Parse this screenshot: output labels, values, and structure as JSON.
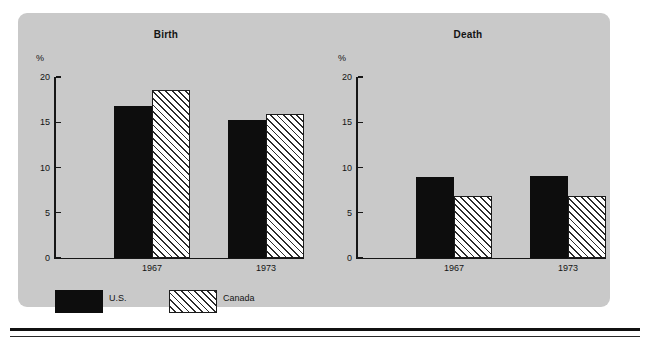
{
  "figure": {
    "background_color": "#c9c9c9",
    "page_color": "#ffffff",
    "rule_color": "#111111"
  },
  "legend": {
    "position": "bottom-left",
    "entries": [
      {
        "label": "U.S.",
        "pattern": "solid-black",
        "color": "#0d0d0d"
      },
      {
        "label": "Canada",
        "pattern": "diagonal-hatch",
        "color": "#ffffff"
      }
    ]
  },
  "chart_data": [
    {
      "type": "bar",
      "title": "Birth",
      "xlabel": "",
      "ylabel": "%",
      "ylim": [
        0,
        20
      ],
      "yticks": [
        0,
        5,
        10,
        15,
        20
      ],
      "ytick_labels": [
        "0",
        "5",
        "10",
        "15",
        "20"
      ],
      "grid": false,
      "categories": [
        "1967",
        "1973"
      ],
      "series": [
        {
          "name": "U.S.",
          "values": [
            16.8,
            15.3
          ]
        },
        {
          "name": "Canada",
          "values": [
            18.6,
            15.9
          ]
        }
      ]
    },
    {
      "type": "bar",
      "title": "Death",
      "xlabel": "",
      "ylabel": "%",
      "ylim": [
        0,
        20
      ],
      "yticks": [
        0,
        5,
        10,
        15,
        20
      ],
      "ytick_labels": [
        "0",
        "5",
        "10",
        "15",
        "20"
      ],
      "grid": false,
      "categories": [
        "1967",
        "1973"
      ],
      "series": [
        {
          "name": "U.S.",
          "values": [
            9.0,
            9.1
          ]
        },
        {
          "name": "Canada",
          "values": [
            6.9,
            6.9
          ]
        }
      ]
    }
  ]
}
